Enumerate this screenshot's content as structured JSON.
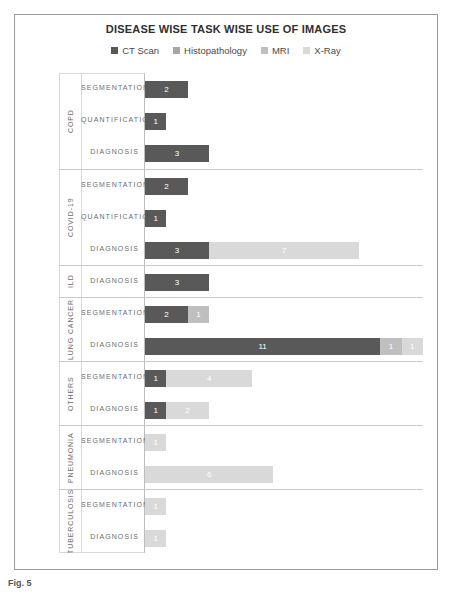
{
  "chart_data": {
    "type": "bar",
    "orientation": "horizontal",
    "stacked": true,
    "title": "DISEASE WISE TASK WISE USE OF IMAGES",
    "xlabel": "",
    "ylabel": "",
    "grid": false,
    "legend_position": "top",
    "xlim": [
      0,
      13
    ],
    "series": [
      {
        "name": "CT Scan",
        "color": "#595959"
      },
      {
        "name": "Histopathology",
        "color": "#a6a6a6"
      },
      {
        "name": "MRI",
        "color": "#bfbfbf"
      },
      {
        "name": "X-Ray",
        "color": "#d9d9d9"
      }
    ],
    "groups": [
      {
        "name": "COPD",
        "rows": [
          {
            "label": "SEGMENTATION",
            "values": {
              "CT Scan": 2,
              "Histopathology": 0,
              "MRI": 0,
              "X-Ray": 0
            }
          },
          {
            "label": "QUANTIFICATION",
            "values": {
              "CT Scan": 1,
              "Histopathology": 0,
              "MRI": 0,
              "X-Ray": 0
            }
          },
          {
            "label": "DIAGNOSIS",
            "values": {
              "CT Scan": 3,
              "Histopathology": 0,
              "MRI": 0,
              "X-Ray": 0
            }
          }
        ]
      },
      {
        "name": "COVID-19",
        "rows": [
          {
            "label": "SEGMENTATION",
            "values": {
              "CT Scan": 2,
              "Histopathology": 0,
              "MRI": 0,
              "X-Ray": 0
            }
          },
          {
            "label": "QUANTIFICATION",
            "values": {
              "CT Scan": 1,
              "Histopathology": 0,
              "MRI": 0,
              "X-Ray": 0
            }
          },
          {
            "label": "DIAGNOSIS",
            "values": {
              "CT Scan": 3,
              "Histopathology": 0,
              "MRI": 0,
              "X-Ray": 7
            }
          }
        ]
      },
      {
        "name": "ILD",
        "rows": [
          {
            "label": "DIAGNOSIS",
            "values": {
              "CT Scan": 3,
              "Histopathology": 0,
              "MRI": 0,
              "X-Ray": 0
            }
          }
        ]
      },
      {
        "name": "LUNG CANCER",
        "rows": [
          {
            "label": "SEGMENTATION",
            "values": {
              "CT Scan": 2,
              "Histopathology": 0,
              "MRI": 1,
              "X-Ray": 0
            }
          },
          {
            "label": "DIAGNOSIS",
            "values": {
              "CT Scan": 11,
              "Histopathology": 0,
              "MRI": 1,
              "X-Ray": 1
            }
          }
        ]
      },
      {
        "name": "OTHERS",
        "rows": [
          {
            "label": "SEGMENTATION",
            "values": {
              "CT Scan": 1,
              "Histopathology": 0,
              "MRI": 0,
              "X-Ray": 4
            }
          },
          {
            "label": "DIAGNOSIS",
            "values": {
              "CT Scan": 1,
              "Histopathology": 0,
              "MRI": 0,
              "X-Ray": 2
            }
          }
        ]
      },
      {
        "name": "PNEUMONIA",
        "rows": [
          {
            "label": "SEGMENTATION",
            "values": {
              "CT Scan": 0,
              "Histopathology": 0,
              "MRI": 0,
              "X-Ray": 1
            }
          },
          {
            "label": "DIAGNOSIS",
            "values": {
              "CT Scan": 0,
              "Histopathology": 0,
              "MRI": 0,
              "X-Ray": 6
            }
          }
        ]
      },
      {
        "name": "TUBERCULOSIS",
        "rows": [
          {
            "label": "SEGMENTATION",
            "values": {
              "CT Scan": 0,
              "Histopathology": 0,
              "MRI": 0,
              "X-Ray": 1
            }
          },
          {
            "label": "DIAGNOSIS",
            "values": {
              "CT Scan": 0,
              "Histopathology": 0,
              "MRI": 0,
              "X-Ray": 1
            }
          }
        ]
      }
    ]
  },
  "caption": {
    "text": "Fig. 5"
  }
}
